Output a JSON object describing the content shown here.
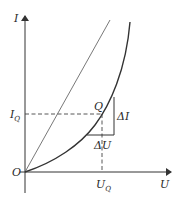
{
  "diagram": {
    "type": "diode I-U characteristic with operating point",
    "axes": {
      "y_label": "I",
      "x_label": "U",
      "origin_label": "O"
    },
    "operating_point": {
      "label": "Q",
      "current_label": "I",
      "current_subscript": "Q",
      "voltage_label": "U",
      "voltage_subscript": "Q"
    },
    "increments": {
      "delta_i": "ΔI",
      "delta_u": "ΔU"
    },
    "colors": {
      "line": "#333333",
      "background": "#ffffff"
    }
  }
}
